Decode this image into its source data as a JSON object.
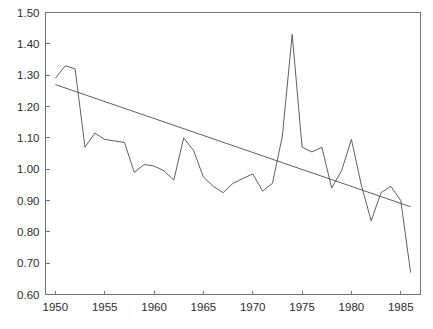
{
  "chart_data": {
    "type": "line",
    "title": "",
    "xlabel": "",
    "ylabel": "",
    "xlim": [
      1949,
      1987
    ],
    "ylim": [
      0.6,
      1.5
    ],
    "grid": false,
    "legend": "none",
    "y_ticks": [
      "0.60",
      "0.70",
      "0.80",
      "0.90",
      "1.00",
      "1.10",
      "1.20",
      "1.30",
      "1.40",
      "1.50"
    ],
    "y_tick_values": [
      0.6,
      0.7,
      0.8,
      0.9,
      1.0,
      1.1,
      1.2,
      1.3,
      1.4,
      1.5
    ],
    "x_ticks": [
      "1950",
      "1955",
      "1960",
      "1965",
      "1970",
      "1975",
      "1980",
      "1985"
    ],
    "x_tick_values": [
      1950,
      1955,
      1960,
      1965,
      1970,
      1975,
      1980,
      1985
    ],
    "x": [
      1950,
      1951,
      1952,
      1953,
      1954,
      1955,
      1956,
      1957,
      1958,
      1959,
      1960,
      1961,
      1962,
      1963,
      1964,
      1965,
      1966,
      1967,
      1968,
      1969,
      1970,
      1971,
      1972,
      1973,
      1974,
      1975,
      1976,
      1977,
      1978,
      1979,
      1980,
      1981,
      1982,
      1983,
      1984,
      1985,
      1986
    ],
    "series": [
      {
        "name": "observed",
        "type": "line",
        "color": "#4a4d50",
        "values": [
          1.29,
          1.33,
          1.32,
          1.07,
          1.115,
          1.095,
          1.09,
          1.085,
          0.99,
          1.015,
          1.01,
          0.995,
          0.965,
          1.1,
          1.06,
          0.975,
          0.945,
          0.925,
          0.955,
          0.97,
          0.985,
          0.93,
          0.955,
          1.105,
          1.43,
          1.07,
          1.055,
          1.07,
          0.94,
          0.995,
          1.095,
          0.95,
          0.835,
          0.925,
          0.945,
          0.9,
          0.67
        ]
      },
      {
        "name": "trend",
        "type": "line",
        "color": "#4a4d50",
        "x_endpoints": [
          1950,
          1986
        ],
        "y_endpoints": [
          1.27,
          0.88
        ]
      }
    ],
    "annotations": []
  },
  "colors": {
    "axis": "#6f7478",
    "line": "#4a4d50",
    "background": "#ffffff",
    "tick_label": "#2a2d30"
  }
}
